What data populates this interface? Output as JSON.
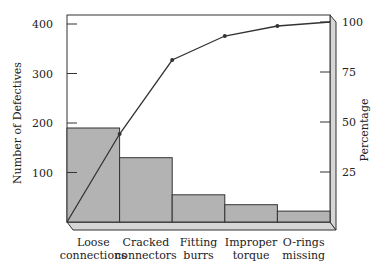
{
  "chart_data": {
    "type": "bar",
    "subtype": "pareto",
    "title": "",
    "categories": [
      "Loose connections",
      "Cracked connectors",
      "Fitting burrs",
      "Improper torque",
      "O-rings missing"
    ],
    "category_lines": [
      [
        "Loose",
        "connections"
      ],
      [
        "Cracked",
        "connectors"
      ],
      [
        "Fitting",
        "burrs"
      ],
      [
        "Improper",
        "torque"
      ],
      [
        "O-rings",
        "missing"
      ]
    ],
    "series": [
      {
        "name": "Number of Defectives",
        "type": "bar",
        "axis": "left",
        "values": [
          190,
          130,
          55,
          35,
          22
        ]
      },
      {
        "name": "Cumulative Percentage",
        "type": "line",
        "axis": "right",
        "values": [
          44,
          81,
          93,
          98,
          100
        ],
        "start": 0
      }
    ],
    "xlabel": "",
    "ylabel": "Number of Defectives",
    "y2label": "Percentage",
    "ylim": [
      0,
      400
    ],
    "y2lim": [
      0,
      100
    ],
    "yticks": [
      "100",
      "200",
      "300",
      "400"
    ],
    "y2ticks": [
      "25",
      "50",
      "75",
      "100"
    ],
    "grid": false,
    "legend": "none",
    "colors": {
      "bar": "#b3b3b3",
      "line": "#333333",
      "frame": "#333333",
      "shelf": "#d6d6d6"
    }
  }
}
